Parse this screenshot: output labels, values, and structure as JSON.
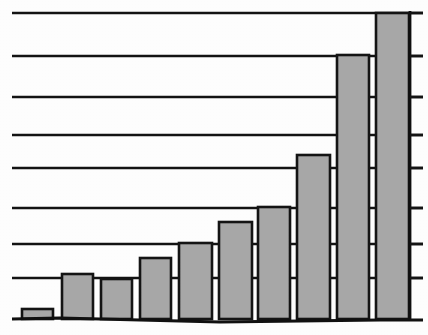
{
  "figure": {
    "background_color": "#ffffff",
    "bar_fill_color": "#a9a9a9",
    "bar_stroke_color": "#151515",
    "grid_color": "#141414",
    "axis_color": "#101010",
    "width_px": 428,
    "height_px": 335
  },
  "chart_data": {
    "type": "bar",
    "title": "",
    "subtitle": "",
    "xlabel": "",
    "ylabel": "",
    "categories": [
      "1",
      "2",
      "3",
      "4",
      "5",
      "6",
      "7",
      "8",
      "9",
      "10"
    ],
    "values": [
      0.26,
      1.16,
      1.04,
      1.58,
      1.97,
      2.52,
      2.9,
      4.26,
      6.89,
      7.97
    ],
    "series": [
      {
        "name": "series-1",
        "values": [
          0.26,
          1.16,
          1.04,
          1.58,
          1.97,
          2.52,
          2.9,
          4.26,
          6.89,
          7.97
        ]
      }
    ],
    "ylim": [
      0,
      8.3
    ],
    "xlim": [
      0,
      10
    ],
    "y_gridline_values": [
      1,
      2,
      3,
      4,
      5,
      6,
      7,
      8
    ],
    "y_tick_values": [
      1,
      2,
      3,
      4,
      5,
      6,
      7,
      8
    ],
    "tick_labels_visible": false,
    "axis_tick_labels": [],
    "legend": [],
    "legend_position": "none",
    "grid": true,
    "grid_orientation": "horizontal",
    "axis_position": "right",
    "annotations": []
  },
  "geometry": {
    "baseline_y": 319,
    "axis_x": 410,
    "grid_left_x": 12,
    "grid_right_x": 423,
    "tick_outer_x": 423,
    "gridline_y": [
      13,
      56,
      97,
      135,
      168,
      208,
      244,
      278
    ],
    "bars": [
      {
        "name": "bar-1",
        "x": 22,
        "width": 31,
        "top_y": 309
      },
      {
        "name": "bar-2",
        "x": 62,
        "width": 31,
        "top_y": 274
      },
      {
        "name": "bar-3",
        "x": 101,
        "width": 31,
        "top_y": 279
      },
      {
        "name": "bar-4",
        "x": 140,
        "width": 31,
        "top_y": 258
      },
      {
        "name": "bar-5",
        "x": 179,
        "width": 33,
        "top_y": 243
      },
      {
        "name": "bar-6",
        "x": 219,
        "width": 33,
        "top_y": 222
      },
      {
        "name": "bar-7",
        "x": 258,
        "width": 32,
        "top_y": 207
      },
      {
        "name": "bar-8",
        "x": 297,
        "width": 33,
        "top_y": 155
      },
      {
        "name": "bar-9",
        "x": 337,
        "width": 32,
        "top_y": 55
      },
      {
        "name": "bar-10",
        "x": 376,
        "width": 33,
        "top_y": 13
      }
    ],
    "baseline_path": "M 12 319 L 60 318 L 140 320 L 220 322 L 300 321 L 380 320 L 423 320"
  }
}
